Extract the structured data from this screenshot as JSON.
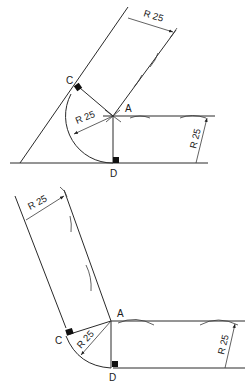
{
  "figures": [
    {
      "name": "acute-angle-fillet",
      "points": {
        "A": "A",
        "C": "C",
        "D": "D"
      },
      "dimensions": {
        "inner_offset": "R 25",
        "fillet_radius": "R 25",
        "horizontal_offset": "R 25"
      }
    },
    {
      "name": "obtuse-angle-fillet",
      "points": {
        "A": "A",
        "C": "C",
        "D": "D"
      },
      "dimensions": {
        "inner_offset": "R 25",
        "fillet_radius": "R 25",
        "horizontal_offset": "R 25"
      }
    }
  ],
  "colors": {
    "line": "#2a2a2a",
    "background": "#ffffff"
  }
}
